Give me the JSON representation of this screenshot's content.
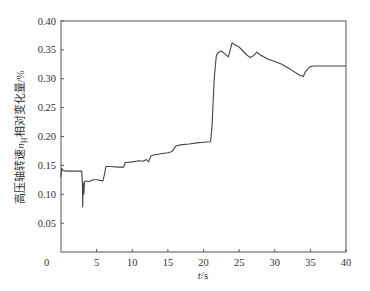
{
  "chart_data": {
    "type": "line",
    "title": "",
    "xlabel": "t/s",
    "ylabel": "高压轴转速n_H相对变化量/%",
    "ylabel_parts": {
      "pre": "高压轴转速",
      "var": "n",
      "sub": "H",
      "post": "相对变化量/%"
    },
    "xlim": [
      0,
      40
    ],
    "ylim": [
      0,
      0.4
    ],
    "x_ticks": [
      0,
      5,
      10,
      15,
      20,
      25,
      30,
      35,
      40
    ],
    "x_tick_labels": [
      "0",
      "5",
      "10",
      "15",
      "20",
      "25",
      "30",
      "35",
      "40"
    ],
    "y_ticks": [
      0.05,
      0.1,
      0.15,
      0.2,
      0.25,
      0.3,
      0.35,
      0.4
    ],
    "y_tick_labels": [
      "0.05",
      "0.10",
      "0.15",
      "0.20",
      "0.25",
      "0.30",
      "0.35",
      "0.40"
    ],
    "origin_label": "0",
    "grid": false,
    "legend": null,
    "series": [
      {
        "name": "n_H relative change",
        "color": "#444444",
        "x": [
          0,
          0.1,
          0.3,
          1.0,
          2.0,
          2.9,
          3.0,
          3.05,
          3.1,
          3.2,
          3.3,
          3.5,
          4.0,
          4.5,
          5.0,
          5.5,
          5.9,
          6.1,
          6.3,
          7.0,
          8.0,
          8.8,
          9.0,
          9.2,
          10.0,
          11.0,
          11.5,
          12.0,
          12.3,
          12.6,
          13.0,
          14.0,
          15.0,
          15.6,
          15.9,
          16.2,
          17.0,
          18.0,
          19.0,
          20.0,
          21.0,
          21.2,
          21.5,
          21.8,
          22.0,
          22.5,
          23.0,
          23.5,
          24.0,
          24.5,
          25.0,
          26.0,
          26.5,
          27.0,
          27.5,
          28.0,
          29.0,
          30.0,
          31.0,
          32.0,
          33.0,
          33.5,
          34.0,
          34.3,
          34.7,
          35.0,
          35.5,
          36.0,
          37.0,
          38.0,
          39.0,
          40.0
        ],
        "y": [
          0.13,
          0.145,
          0.141,
          0.14,
          0.14,
          0.14,
          0.12,
          0.078,
          0.12,
          0.1,
          0.122,
          0.123,
          0.122,
          0.125,
          0.125,
          0.124,
          0.123,
          0.135,
          0.148,
          0.148,
          0.147,
          0.147,
          0.155,
          0.155,
          0.156,
          0.158,
          0.157,
          0.16,
          0.156,
          0.166,
          0.168,
          0.17,
          0.172,
          0.174,
          0.18,
          0.184,
          0.186,
          0.187,
          0.189,
          0.19,
          0.191,
          0.22,
          0.3,
          0.34,
          0.345,
          0.348,
          0.343,
          0.338,
          0.362,
          0.358,
          0.355,
          0.342,
          0.337,
          0.34,
          0.346,
          0.341,
          0.334,
          0.33,
          0.325,
          0.318,
          0.31,
          0.306,
          0.304,
          0.312,
          0.318,
          0.321,
          0.322,
          0.322,
          0.322,
          0.322,
          0.322,
          0.322
        ]
      }
    ]
  }
}
